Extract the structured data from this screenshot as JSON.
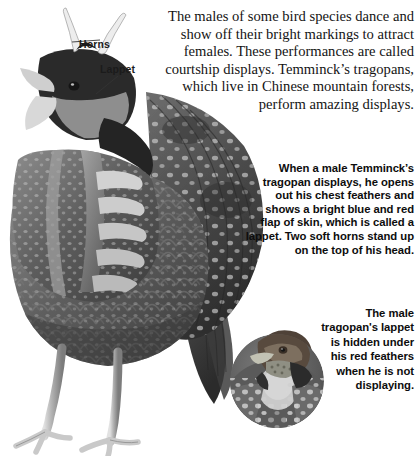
{
  "page": {
    "background_color": "#ffffff",
    "width": 420,
    "height": 456
  },
  "illustration": {
    "name": "temmincks-tragopan-displaying",
    "description": "Grayscale illustration of a male Temminck's tragopan in full courtship display, showing the spread lappet and erect horns",
    "ink_color": "#3a3a3a"
  },
  "inset": {
    "name": "tragopan-head-photo",
    "description": "Circular grayscale photograph of a Temminck's tragopan head with lappet hidden",
    "shape": "circle"
  },
  "callouts": [
    {
      "id": "horns",
      "label": "Horns",
      "icon": "leader-line-icon"
    },
    {
      "id": "lappet",
      "label": "Lappet",
      "icon": "leader-line-icon"
    }
  ],
  "text_blocks": {
    "intro": "The males of some bird species dance and show off their bright markings to attract females. These performances are called courtship displays. Temminck’s tragopans, which live in Chinese mountain forests, perform amazing displays.",
    "display": "When a male Temminck’s tragopan displays, he opens out his chest feathers and shows a bright blue and red flap of skin, which is called a lappet. Two soft horns stand up on the top of his head.",
    "hidden": "The male tragopan's lappet is hidden under his red feathers when he is not displaying."
  }
}
